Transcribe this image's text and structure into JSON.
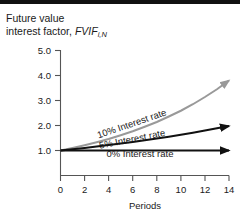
{
  "figure": {
    "top_rule_color": "#111111",
    "background": "#ffffff",
    "y_axis_caption_line1": "Future value",
    "y_axis_caption_line2_prefix": "interest factor, ",
    "y_axis_caption_symbol": "FVIF",
    "y_axis_caption_subscript": "i,N"
  },
  "chart_data": {
    "type": "line",
    "xlabel": "Periods",
    "ylabel": "Future value interest factor, FVIF i,N",
    "xlim": [
      0,
      14
    ],
    "ylim": [
      0,
      5.0
    ],
    "xticks": [
      0,
      2,
      4,
      6,
      8,
      10,
      12,
      14
    ],
    "xticklabels": [
      "0",
      "2",
      "4",
      "6",
      "8",
      "10",
      "12",
      "14"
    ],
    "yticks": [
      1.0,
      2.0,
      3.0,
      4.0,
      5.0
    ],
    "yticklabels": [
      "1.0",
      "2.0",
      "3.0",
      "4.0",
      "5.0"
    ],
    "grid": false,
    "legend": "inline-annotations",
    "x": [
      0,
      1,
      2,
      3,
      4,
      5,
      6,
      7,
      8,
      9,
      10,
      11,
      12,
      13,
      14
    ],
    "series": [
      {
        "name": "10% Interest rate",
        "color": "#999999",
        "width": 2.0,
        "arrow": true,
        "label": "10% Interest rate",
        "label_x": 6.0,
        "label_y": 1.95,
        "label_rotation": -19,
        "values": [
          1.0,
          1.1,
          1.21,
          1.33,
          1.46,
          1.61,
          1.77,
          1.95,
          2.14,
          2.36,
          2.59,
          2.85,
          3.14,
          3.45,
          3.8
        ]
      },
      {
        "name": "5% Interest rate",
        "color": "#111111",
        "width": 2.2,
        "arrow": true,
        "label": "5% Interest rate",
        "label_x": 6.0,
        "label_y": 1.33,
        "label_rotation": -11,
        "values": [
          1.0,
          1.05,
          1.1,
          1.16,
          1.22,
          1.28,
          1.34,
          1.41,
          1.48,
          1.55,
          1.63,
          1.71,
          1.8,
          1.89,
          1.98
        ]
      },
      {
        "name": "0% Interest rate",
        "color": "#111111",
        "width": 2.2,
        "arrow": true,
        "label": "0% Interest rate",
        "label_x": 6.6,
        "label_y": 0.74,
        "label_rotation": 0,
        "values": [
          1.0,
          1.0,
          1.0,
          1.0,
          1.0,
          1.0,
          1.0,
          1.0,
          1.0,
          1.0,
          1.0,
          1.0,
          1.0,
          1.0,
          1.0
        ]
      }
    ]
  }
}
